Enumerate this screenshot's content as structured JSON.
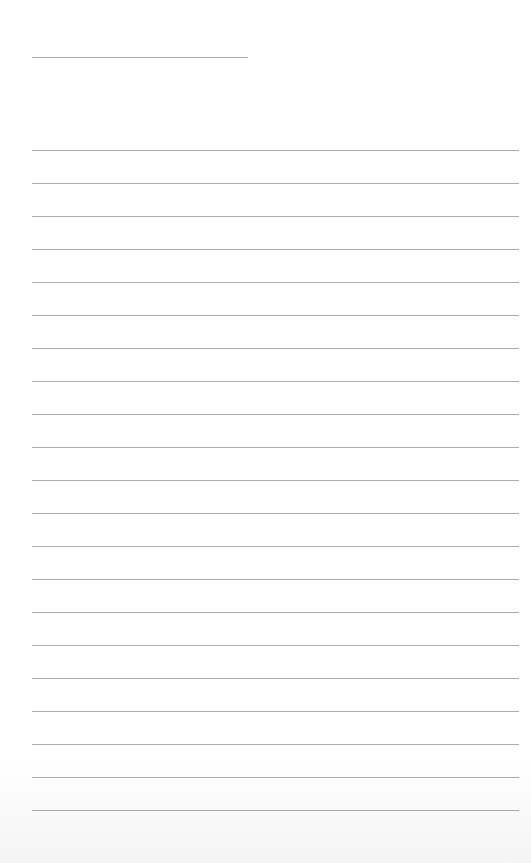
{
  "page": {
    "type": "lined-paper",
    "background_color": "#ffffff",
    "line_color": "#ababab",
    "header_line": {
      "x": 32,
      "y": 57,
      "width": 216
    },
    "ruled_lines": {
      "count": 21,
      "first_y": 150,
      "spacing": 33,
      "x": 32,
      "width": 487
    }
  }
}
